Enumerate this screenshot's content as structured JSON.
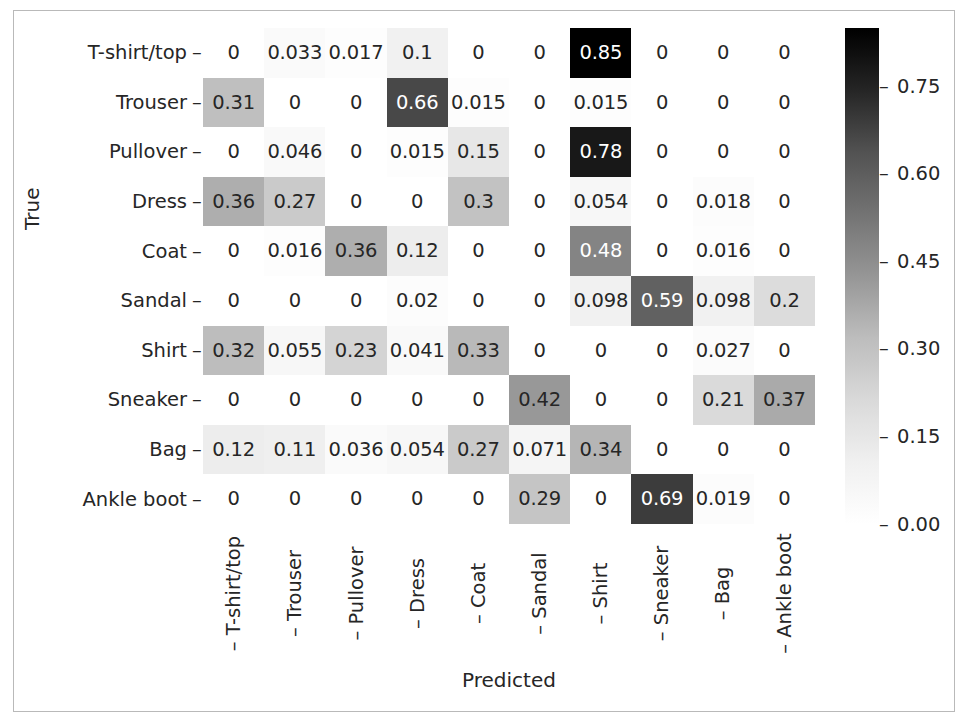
{
  "chart_data": {
    "type": "heatmap",
    "title": "",
    "xlabel": "Predicted",
    "ylabel": "True",
    "categories_x": [
      "T-shirt/top",
      "Trouser",
      "Pullover",
      "Dress",
      "Coat",
      "Sandal",
      "Shirt",
      "Sneaker",
      "Bag",
      "Ankle boot"
    ],
    "categories_y": [
      "T-shirt/top",
      "Trouser",
      "Pullover",
      "Dress",
      "Coat",
      "Sandal",
      "Shirt",
      "Sneaker",
      "Bag",
      "Ankle boot"
    ],
    "matrix": [
      [
        0,
        0.033,
        0.017,
        0.1,
        0,
        0,
        0.85,
        0,
        0,
        0
      ],
      [
        0.31,
        0,
        0,
        0.66,
        0.015,
        0,
        0.015,
        0,
        0,
        0
      ],
      [
        0,
        0.046,
        0,
        0.015,
        0.15,
        0,
        0.78,
        0,
        0,
        0
      ],
      [
        0.36,
        0.27,
        0,
        0,
        0.3,
        0,
        0.054,
        0,
        0.018,
        0
      ],
      [
        0,
        0.016,
        0.36,
        0.12,
        0,
        0,
        0.48,
        0,
        0.016,
        0
      ],
      [
        0,
        0,
        0,
        0.02,
        0,
        0,
        0.098,
        0.59,
        0.098,
        0.2
      ],
      [
        0.32,
        0.055,
        0.23,
        0.041,
        0.33,
        0,
        0,
        0,
        0.027,
        0
      ],
      [
        0,
        0,
        0,
        0,
        0,
        0.42,
        0,
        0,
        0.21,
        0.37
      ],
      [
        0.12,
        0.11,
        0.036,
        0.054,
        0.27,
        0.071,
        0.34,
        0,
        0,
        0
      ],
      [
        0,
        0,
        0,
        0,
        0,
        0.29,
        0,
        0.69,
        0.019,
        0
      ]
    ],
    "cell_labels": [
      [
        "0",
        "0.033",
        "0.017",
        "0.1",
        "0",
        "0",
        "0.85",
        "0",
        "0",
        "0"
      ],
      [
        "0.31",
        "0",
        "0",
        "0.66",
        "0.015",
        "0",
        "0.015",
        "0",
        "0",
        "0"
      ],
      [
        "0",
        "0.046",
        "0",
        "0.015",
        "0.15",
        "0",
        "0.78",
        "0",
        "0",
        "0"
      ],
      [
        "0.36",
        "0.27",
        "0",
        "0",
        "0.3",
        "0",
        "0.054",
        "0",
        "0.018",
        "0"
      ],
      [
        "0",
        "0.016",
        "0.36",
        "0.12",
        "0",
        "0",
        "0.48",
        "0",
        "0.016",
        "0"
      ],
      [
        "0",
        "0",
        "0",
        "0.02",
        "0",
        "0",
        "0.098",
        "0.59",
        "0.098",
        "0.2"
      ],
      [
        "0.32",
        "0.055",
        "0.23",
        "0.041",
        "0.33",
        "0",
        "0",
        "0",
        "0.027",
        "0"
      ],
      [
        "0",
        "0",
        "0",
        "0",
        "0",
        "0.42",
        "0",
        "0",
        "0.21",
        "0.37"
      ],
      [
        "0.12",
        "0.11",
        "0.036",
        "0.054",
        "0.27",
        "0.071",
        "0.34",
        "0",
        "0",
        "0"
      ],
      [
        "0",
        "0",
        "0",
        "0",
        "0",
        "0.29",
        "0",
        "0.69",
        "0.019",
        "0"
      ]
    ],
    "colormap": "Greys",
    "vmin": 0,
    "vmax": 0.85,
    "colorbar": {
      "ticks": [
        "0.00",
        "0.15",
        "0.30",
        "0.45",
        "0.60",
        "0.75"
      ],
      "tick_values": [
        0.0,
        0.15,
        0.3,
        0.45,
        0.6,
        0.75
      ],
      "position": "right",
      "orientation": "vertical"
    },
    "grid": false,
    "background_color": "#ffffff",
    "text_color": "#262626",
    "light_text_color": "#ffffff"
  },
  "axes": {
    "ylabel": "True",
    "xlabel": "Predicted",
    "tick_dash": "–"
  }
}
